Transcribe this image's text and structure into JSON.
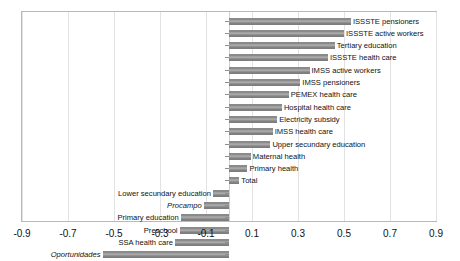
{
  "chart_data": {
    "type": "bar",
    "orientation": "horizontal",
    "title": "",
    "xlabel": "",
    "ylabel": "",
    "xlim": [
      -0.9,
      0.9
    ],
    "xticks": [
      "-0.9",
      "-0.7",
      "-0.5",
      "-0.3",
      "-0.1",
      "0.1",
      "0.3",
      "0.5",
      "0.7",
      "0.9"
    ],
    "xtick_values": [
      -0.9,
      -0.7,
      -0.5,
      -0.3,
      -0.1,
      0.1,
      0.3,
      0.5,
      0.7,
      0.9
    ],
    "grid": true,
    "legend": "none",
    "bar_color": "#8a8a8a",
    "categories": [
      "ISSSTE  pensioners",
      "ISSSTE  active workers",
      "Tertiary education",
      "ISSSTE health care",
      "IMSS  active workers",
      "IMSS  pensioners",
      "PEMEX health care",
      "Hospital  health care",
      "Electricity subsidy",
      "IMSS health care",
      "Upper secundary education",
      "Maternal health",
      "Primary health",
      "Total",
      "Lower secundary education",
      "Procampo",
      "Primary education",
      "Preschool",
      "SSA  health care",
      "Oportunidades"
    ],
    "values": [
      0.53,
      0.5,
      0.46,
      0.43,
      0.35,
      0.31,
      0.26,
      0.23,
      0.21,
      0.19,
      0.18,
      0.095,
      0.08,
      0.045,
      -0.07,
      -0.11,
      -0.21,
      -0.215,
      -0.235,
      -0.55
    ],
    "italic_categories": [
      "Procampo",
      "Oportunidades"
    ]
  }
}
